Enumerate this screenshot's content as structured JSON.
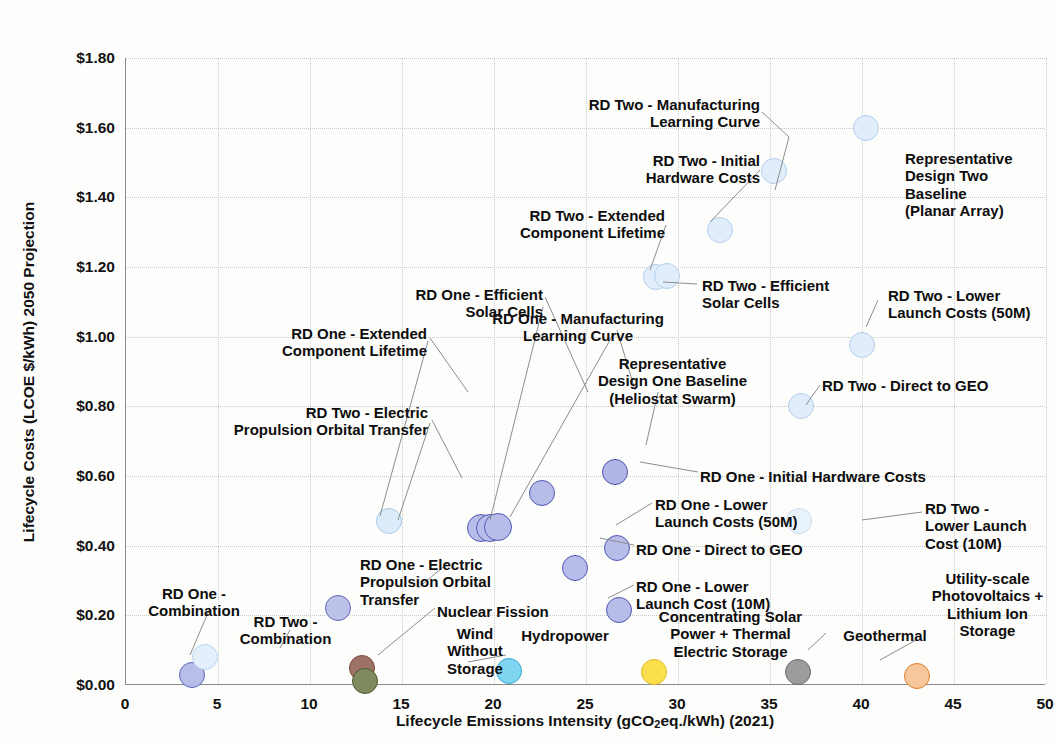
{
  "chart_data": {
    "type": "scatter",
    "title": "",
    "xlabel": "Lifecycle Emissions Intensity (gCO2eq./kWh) (2021)",
    "ylabel": "Lifecycle Costs (LCOE $/kWh) 2050 Projection",
    "xlim": [
      0,
      50
    ],
    "ylim": [
      0.0,
      1.8
    ],
    "xticks": [
      "0",
      "5",
      "10",
      "15",
      "20",
      "25",
      "30",
      "35",
      "40",
      "45",
      "50"
    ],
    "yticks": [
      "$0.00",
      "$0.20",
      "$0.40",
      "$0.60",
      "$0.80",
      "$1.00",
      "$1.20",
      "$1.40",
      "$1.60",
      "$1.80"
    ],
    "grid": true,
    "legend": "none (direct point labels with leader lines)",
    "points": [
      {
        "label": "RD One - Combination",
        "x": 3.6,
        "y": 0.03,
        "fill": "#b9bee8",
        "stroke": "#5b63b8",
        "r": 13
      },
      {
        "label": "RD Two - Combination",
        "x": 4.3,
        "y": 0.08,
        "fill": "#e3effb",
        "stroke": "#b9d4ee",
        "r": 13
      },
      {
        "label": "RD One - Electric Propulsion Orbital Transfer",
        "x": 11.5,
        "y": 0.22,
        "fill": "#bcc2ea",
        "stroke": "#5d66bb",
        "r": 13
      },
      {
        "label": "Nuclear Fission",
        "x": 12.8,
        "y": 0.048,
        "fill": "#9d7266",
        "stroke": "#7a4a3c",
        "r": 13
      },
      {
        "label": "Wind Without Storage",
        "x": 13.0,
        "y": 0.012,
        "fill": "#7f8a5e",
        "stroke": "#4c5a31",
        "r": 13
      },
      {
        "label": "RD Two - Electric Propulsion Orbital Transfer",
        "x": 14.3,
        "y": 0.47,
        "fill": "#dcebf9",
        "stroke": "#a9cbe8",
        "r": 13
      },
      {
        "label": "RD One - Extended Component Lifetime",
        "x": 19.3,
        "y": 0.45,
        "fill": "#b7bde8",
        "stroke": "#5058b4",
        "r": 14
      },
      {
        "label": "RD One - Efficient Solar Cells",
        "x": 19.8,
        "y": 0.452,
        "fill": "#b7bde8",
        "stroke": "#5058b4",
        "r": 14
      },
      {
        "label": "RD One - Manufacturing Learning Curve",
        "x": 20.2,
        "y": 0.455,
        "fill": "#b7bde8",
        "stroke": "#5058b4",
        "r": 14
      },
      {
        "label": "Hydropower",
        "x": 20.8,
        "y": 0.04,
        "fill": "#7fd4f0",
        "stroke": "#37a8d8",
        "r": 13
      },
      {
        "label": "Representative Design One Baseline (Heliostat Swarm)",
        "x": 22.6,
        "y": 0.55,
        "fill": "#b7bde8",
        "stroke": "#5058b4",
        "r": 13
      },
      {
        "label": "RD One - Lower Launch Costs (50M)",
        "x": 24.4,
        "y": 0.335,
        "fill": "#b7bde8",
        "stroke": "#5058b4",
        "r": 13
      },
      {
        "label": "RD One - Initial Hardware Costs",
        "x": 26.6,
        "y": 0.612,
        "fill": "#b0b7e5",
        "stroke": "#4a52ae",
        "r": 13
      },
      {
        "label": "RD One - Direct to GEO",
        "x": 26.7,
        "y": 0.392,
        "fill": "#b7bde8",
        "stroke": "#5058b4",
        "r": 13
      },
      {
        "label": "RD One - Lower Launch Cost (10M)",
        "x": 26.8,
        "y": 0.215,
        "fill": "#b7bde8",
        "stroke": "#5058b4",
        "r": 13
      },
      {
        "label": "Concentrating Solar Power + Thermal Electric Storage",
        "x": 28.7,
        "y": 0.038,
        "fill": "#fbe04d",
        "stroke": "#e0b91c",
        "r": 13
      },
      {
        "label": "RD Two - Extended Component Lifetime",
        "x": 28.8,
        "y": 1.17,
        "fill": "#e1edfa",
        "stroke": "#b5d0ec",
        "r": 13
      },
      {
        "label": "RD Two - Efficient Solar Cells",
        "x": 29.4,
        "y": 1.175,
        "fill": "#e1edfa",
        "stroke": "#b5d0ec",
        "r": 13
      },
      {
        "label": "RD Two - Initial Hardware Costs",
        "x": 32.3,
        "y": 1.305,
        "fill": "#e1edfa",
        "stroke": "#b5d0ec",
        "r": 13
      },
      {
        "label": "Geothermal",
        "x": 36.5,
        "y": 0.038,
        "fill": "#9c9c9c",
        "stroke": "#6d6d6d",
        "r": 13
      },
      {
        "label": "RD Two - Direct to GEO",
        "x": 36.7,
        "y": 0.8,
        "fill": "#e1edfa",
        "stroke": "#b5d0ec",
        "r": 13
      },
      {
        "label": "RD Two - Manufacturing Learning Curve",
        "x": 35.2,
        "y": 1.475,
        "fill": "#e1edfa",
        "stroke": "#b5d0ec",
        "r": 13
      },
      {
        "label": "RD Two - Lower Launch Costs (50M)",
        "x": 40.0,
        "y": 0.975,
        "fill": "#e1edfa",
        "stroke": "#b5d0ec",
        "r": 13
      },
      {
        "label": "Representative Design Two Baseline (Planar Array)",
        "x": 40.2,
        "y": 1.598,
        "fill": "#e1edfa",
        "stroke": "#b5d0ec",
        "r": 13
      },
      {
        "label": "Utility-scale Photovoltaics + Lithium Ion Storage",
        "x": 43.0,
        "y": 0.025,
        "fill": "#f5c79a",
        "stroke": "#e07f2a",
        "r": 13
      },
      {
        "label": "RD Two - Lower Launch Cost (10M)",
        "x": 36.6,
        "y": 0.472,
        "fill": "#e8f2fb",
        "stroke": "#c6dcf0",
        "r": 13
      }
    ],
    "annotations": [
      {
        "text": "RD Two - Manufacturing\nLearning Curve",
        "align": "right",
        "x": 550,
        "y": 96,
        "w": 210
      },
      {
        "text": "RD Two - Initial\nHardware Costs",
        "align": "right",
        "x": 547,
        "y": 152,
        "w": 213
      },
      {
        "text": "Representative\nDesign Two\nBaseline\n(Planar Array)",
        "align": "left",
        "x": 905,
        "y": 150,
        "w": 150
      },
      {
        "text": "RD Two - Extended\nComponent Lifetime",
        "align": "right",
        "x": 440,
        "y": 207,
        "w": 225
      },
      {
        "text": "RD One - Efficient\nSolar Cells",
        "align": "right",
        "x": 348,
        "y": 286,
        "w": 195
      },
      {
        "text": "RD Two - Efficient\nSolar Cells",
        "align": "left",
        "x": 702,
        "y": 277,
        "w": 190
      },
      {
        "text": "RD Two - Lower\nLaunch Costs (50M)",
        "align": "left",
        "x": 888,
        "y": 287,
        "w": 170
      },
      {
        "text": "RD One - Manufacturing\nLearning Curve",
        "align": "center",
        "x": 462,
        "y": 310,
        "w": 232
      },
      {
        "text": "RD One - Extended\nComponent Lifetime",
        "align": "right",
        "x": 195,
        "y": 325,
        "w": 232
      },
      {
        "text": "Representative\nDesign One Baseline\n(Heliostat Swarm)",
        "align": "center",
        "x": 575,
        "y": 355,
        "w": 195
      },
      {
        "text": "RD Two - Direct to GEO",
        "align": "left",
        "x": 822,
        "y": 377,
        "w": 200
      },
      {
        "text": "RD Two - Electric\nPropulsion Orbital Transfer",
        "align": "right",
        "x": 150,
        "y": 404,
        "w": 278
      },
      {
        "text": "RD One - Initial Hardware Costs",
        "align": "left",
        "x": 700,
        "y": 468,
        "w": 280
      },
      {
        "text": "RD One - Lower\nLaunch Costs (50M)",
        "align": "left",
        "x": 655,
        "y": 496,
        "w": 180
      },
      {
        "text": "RD Two -\nLower Launch\nCost (10M)",
        "align": "left",
        "x": 925,
        "y": 500,
        "w": 130
      },
      {
        "text": "RD One - Direct to GEO",
        "align": "left",
        "x": 636,
        "y": 541,
        "w": 200
      },
      {
        "text": "RD One - Electric\nPropulsion Orbital\nTransfer",
        "align": "left",
        "x": 360,
        "y": 556,
        "w": 180
      },
      {
        "text": "RD One - Lower\nLaunch Cost (10M)",
        "align": "left",
        "x": 636,
        "y": 578,
        "w": 180
      },
      {
        "text": "Utility-scale\nPhotovoltaics +\nLithium Ion\nStorage",
        "align": "center",
        "x": 920,
        "y": 570,
        "w": 135
      },
      {
        "text": "Nuclear Fission",
        "align": "left",
        "x": 437,
        "y": 603,
        "w": 160
      },
      {
        "text": "RD One -\nCombination",
        "align": "center",
        "x": 134,
        "y": 585,
        "w": 120
      },
      {
        "text": "RD Two -\nCombination",
        "align": "center",
        "x": 228,
        "y": 613,
        "w": 115
      },
      {
        "text": "Wind\nWithout\nStorage",
        "align": "center",
        "x": 430,
        "y": 625,
        "w": 90
      },
      {
        "text": "Hydropower",
        "align": "center",
        "x": 510,
        "y": 627,
        "w": 110
      },
      {
        "text": "Concentrating Solar\nPower + Thermal\nElectric Storage",
        "align": "center",
        "x": 638,
        "y": 608,
        "w": 185
      },
      {
        "text": "Geothermal",
        "align": "center",
        "x": 830,
        "y": 627,
        "w": 110
      }
    ],
    "leaders": [
      [
        762,
        112,
        789,
        137
      ],
      [
        789,
        137,
        775,
        190
      ],
      [
        760,
        170,
        710,
        222
      ],
      [
        666,
        225,
        650,
        270
      ],
      [
        545,
        297,
        588,
        392
      ],
      [
        543,
        307,
        490,
        520
      ],
      [
        663,
        282,
        697,
        284
      ],
      [
        878,
        300,
        866,
        327
      ],
      [
        617,
        330,
        635,
        390
      ],
      [
        614,
        333,
        510,
        517
      ],
      [
        430,
        338,
        468,
        392
      ],
      [
        428,
        341,
        380,
        516
      ],
      [
        820,
        385,
        806,
        405
      ],
      [
        658,
        392,
        646,
        445
      ],
      [
        432,
        420,
        462,
        478
      ],
      [
        430,
        423,
        398,
        520
      ],
      [
        698,
        472,
        640,
        462
      ],
      [
        652,
        503,
        616,
        525
      ],
      [
        922,
        512,
        862,
        520
      ],
      [
        634,
        545,
        600,
        538
      ],
      [
        448,
        563,
        418,
        588
      ],
      [
        634,
        585,
        608,
        598
      ],
      [
        916,
        640,
        880,
        660
      ],
      [
        435,
        608,
        378,
        655
      ],
      [
        506,
        655,
        468,
        662
      ],
      [
        826,
        633,
        808,
        650
      ],
      [
        210,
        608,
        190,
        655
      ],
      [
        290,
        630,
        280,
        648
      ]
    ]
  }
}
